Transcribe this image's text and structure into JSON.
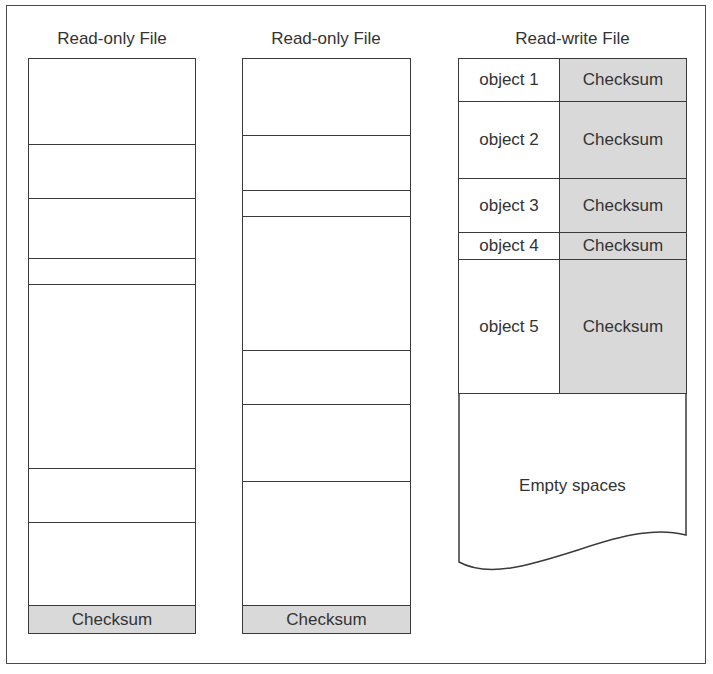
{
  "diagram": {
    "columns": [
      {
        "title": "Read-only File",
        "divider_positions_px": [
          85,
          139,
          199,
          225,
          409,
          463
        ],
        "footer": "Checksum"
      },
      {
        "title": "Read-only File",
        "divider_positions_px": [
          76,
          131,
          157,
          291,
          345,
          422
        ],
        "footer": "Checksum"
      },
      {
        "title": "Read-write File",
        "rows": [
          {
            "object": "object 1",
            "checksum": "Checksum"
          },
          {
            "object": "object 2",
            "checksum": "Checksum"
          },
          {
            "object": "object 3",
            "checksum": "Checksum"
          },
          {
            "object": "object 4",
            "checksum": "Checksum"
          },
          {
            "object": "object 5",
            "checksum": "Checksum"
          }
        ],
        "empty_label": "Empty spaces"
      }
    ],
    "colors": {
      "checksum_fill": "#d9d9d9",
      "line": "#3a3a3a"
    }
  }
}
